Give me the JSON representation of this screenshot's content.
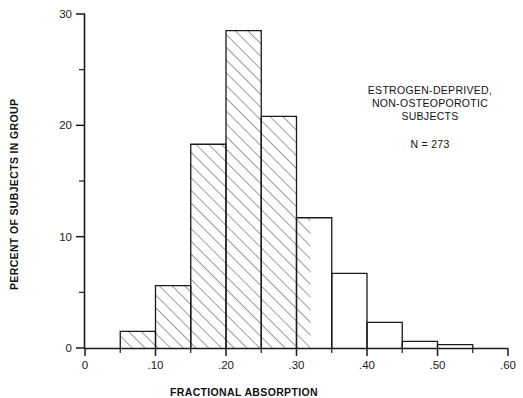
{
  "chart_data": {
    "type": "bar",
    "title": "",
    "subtitle": "",
    "xlabel": "FRACTIONAL ABSORPTION",
    "ylabel": "PERCENT OF SUBJECTS IN GROUP",
    "xlim": [
      0,
      0.6
    ],
    "ylim": [
      0,
      30
    ],
    "grid": false,
    "legend_position": "none",
    "bin_width": 0.05,
    "categories": [
      "0.05-0.10",
      "0.10-0.15",
      "0.15-0.20",
      "0.20-0.25",
      "0.25-0.30",
      "0.30-0.35",
      "0.35-0.40",
      "0.40-0.45",
      "0.45-0.50",
      "0.50-0.55"
    ],
    "bin_starts": [
      0.05,
      0.1,
      0.15,
      0.2,
      0.25,
      0.3,
      0.35,
      0.4,
      0.45,
      0.5
    ],
    "bin_ends": [
      0.1,
      0.15,
      0.2,
      0.25,
      0.3,
      0.35,
      0.4,
      0.45,
      0.5,
      0.55
    ],
    "values": [
      1.5,
      5.6,
      18.3,
      28.5,
      20.8,
      11.7,
      6.7,
      2.3,
      0.6,
      0.3
    ],
    "hatched_until_x": 0.32,
    "x_ticks": [
      0,
      0.1,
      0.2,
      0.3,
      0.4,
      0.5,
      0.6
    ],
    "x_tick_labels": [
      "0",
      ".10",
      ".20",
      ".30",
      ".40",
      ".50",
      ".60"
    ],
    "x_minor_ticks": [
      0.05,
      0.15,
      0.25,
      0.35,
      0.45,
      0.55
    ],
    "y_ticks": [
      0,
      10,
      20,
      30
    ],
    "y_tick_labels": [
      "0",
      "10",
      "20",
      "30"
    ],
    "y_minor_ticks": [
      5,
      15,
      25
    ],
    "annotations": [
      "ESTROGEN-DEPRIVED,",
      "NON-OSTEOPOROTIC",
      "SUBJECTS"
    ],
    "sample_size_label": "N = 273",
    "colors": {
      "axis": "#1a1a1a",
      "bar_outline": "#1a1a1a",
      "hatch": "#333333",
      "background": "#ffffff"
    }
  },
  "axis": {
    "y_title": "PERCENT OF SUBJECTS IN GROUP",
    "x_title": "FRACTIONAL ABSORPTION"
  },
  "annotation_block": {
    "line1": "ESTROGEN-DEPRIVED,",
    "line2": "NON-OSTEOPOROTIC",
    "line3": "SUBJECTS",
    "n_label": "N = 273"
  },
  "y_labels": {
    "t0": "0",
    "t1": "10",
    "t2": "20",
    "t3": "30"
  },
  "x_labels": {
    "t0": "0",
    "t1": ".10",
    "t2": ".20",
    "t3": ".30",
    "t4": ".40",
    "t5": ".50",
    "t6": ".60"
  }
}
